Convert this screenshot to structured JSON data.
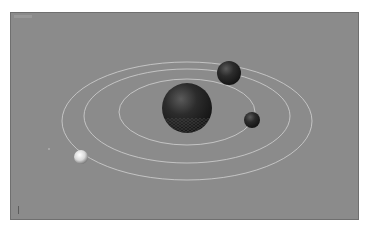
{
  "viewport": {
    "label": "",
    "background": "#8b8b8b",
    "orbit_color": "#d2d2d2"
  },
  "scene": {
    "orbits": [
      {
        "name": "inner-orbit",
        "cx": 187,
        "cy": 112,
        "rx": 68,
        "ry": 33
      },
      {
        "name": "middle-orbit",
        "cx": 187,
        "cy": 116,
        "rx": 103,
        "ry": 47
      },
      {
        "name": "outer-orbit",
        "cx": 187,
        "cy": 121,
        "rx": 125,
        "ry": 59
      }
    ],
    "bodies": [
      {
        "name": "sun-sphere",
        "cx": 187,
        "cy": 108,
        "r": 25,
        "color": "#2a2a2a"
      },
      {
        "name": "planet-top-right",
        "cx": 229,
        "cy": 73,
        "r": 12,
        "color": "#2e2e2e"
      },
      {
        "name": "planet-right",
        "cx": 252,
        "cy": 120,
        "r": 8,
        "color": "#2b2b2b"
      },
      {
        "name": "planet-left-light",
        "cx": 81,
        "cy": 157,
        "r": 7,
        "color": "#e4e4e4"
      }
    ]
  }
}
